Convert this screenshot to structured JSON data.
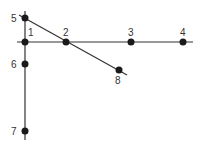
{
  "diagram": {
    "type": "graph",
    "nodes": [
      {
        "id": "1",
        "label": "1",
        "x": 25,
        "y": 42,
        "lx": 28,
        "ly": 36
      },
      {
        "id": "2",
        "label": "2",
        "x": 66,
        "y": 42,
        "lx": 63,
        "ly": 36
      },
      {
        "id": "3",
        "label": "3",
        "x": 131,
        "y": 42,
        "lx": 128,
        "ly": 36
      },
      {
        "id": "4",
        "label": "4",
        "x": 183,
        "y": 42,
        "lx": 180,
        "ly": 36
      },
      {
        "id": "5",
        "label": "5",
        "x": 25,
        "y": 18,
        "lx": 11,
        "ly": 22
      },
      {
        "id": "6",
        "label": "6",
        "x": 25,
        "y": 64,
        "lx": 11,
        "ly": 68
      },
      {
        "id": "7",
        "label": "7",
        "x": 25,
        "y": 131,
        "lx": 11,
        "ly": 135
      },
      {
        "id": "8",
        "label": "8",
        "x": 119,
        "y": 70,
        "lx": 115,
        "ly": 84
      }
    ],
    "edges": [
      {
        "from": "1",
        "to": "2"
      },
      {
        "from": "2",
        "to": "3"
      },
      {
        "from": "3",
        "to": "4"
      },
      {
        "from": "5",
        "to": "1"
      },
      {
        "from": "1",
        "to": "6"
      },
      {
        "from": "6",
        "to": "7"
      },
      {
        "from": "5",
        "to": "2"
      },
      {
        "from": "2",
        "to": "8"
      }
    ],
    "lines": {
      "horizontal": {
        "x1": 17,
        "y1": 42,
        "x2": 193,
        "y2": 42
      },
      "vertical": {
        "x1": 25,
        "y1": 11,
        "x2": 25,
        "y2": 140
      },
      "diagonal": {
        "x1": 19,
        "y1": 15,
        "x2": 127,
        "y2": 75
      }
    }
  }
}
